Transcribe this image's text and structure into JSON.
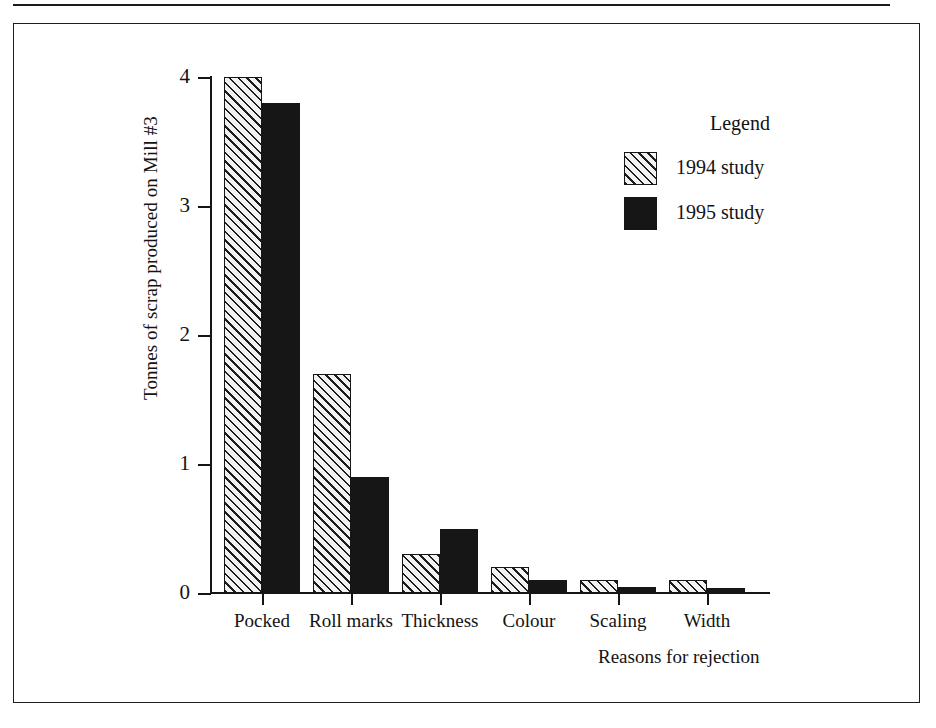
{
  "chart_data": {
    "type": "bar",
    "title": "",
    "xlabel": "Reasons for rejection",
    "ylabel": "Tonnes of scrap produced on Mill #3",
    "categories": [
      "Pocked",
      "Roll marks",
      "Thickness",
      "Colour",
      "Scaling",
      "Width"
    ],
    "series": [
      {
        "name": "1994 study",
        "values": [
          4.0,
          1.7,
          0.3,
          0.2,
          0.1,
          0.1
        ],
        "fill": "hatched",
        "color": "#f2f2f2"
      },
      {
        "name": "1995 study",
        "values": [
          3.8,
          0.9,
          0.5,
          0.1,
          0.05,
          0.04
        ],
        "fill": "solid",
        "color": "#161616"
      }
    ],
    "ylim": [
      0,
      4
    ],
    "yticks": [
      0,
      1,
      2,
      3,
      4
    ],
    "ytick_labels": [
      "0",
      "1",
      "2",
      "3",
      "4"
    ],
    "grid": false,
    "legend_position": "upper right",
    "legend_title": "Legend"
  },
  "legend": {
    "title": "Legend",
    "entries": [
      {
        "label": "1994 study"
      },
      {
        "label": "1995 study"
      }
    ]
  },
  "axes": {
    "y_title": "Tonnes of scrap produced on Mill #3",
    "x_title": "Reasons for rejection"
  }
}
